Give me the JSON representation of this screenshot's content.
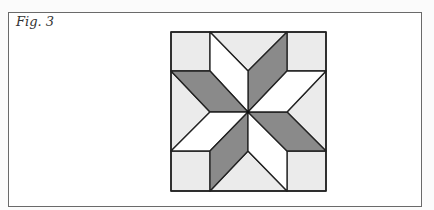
{
  "figure": {
    "caption": "Fig. 3",
    "colors": {
      "background": "#ffffff",
      "light_fill": "#ebebeb",
      "dark_fill": "#8a8a8a",
      "white_fill": "#ffffff",
      "stroke": "#222222"
    },
    "block": {
      "x": 171,
      "y": 32,
      "width": 155,
      "height": 159,
      "grid_x": [
        171,
        210,
        248,
        287,
        326
      ],
      "grid_y": [
        32,
        71,
        112,
        151,
        191
      ],
      "center": [
        248,
        112
      ]
    },
    "pieces": {
      "corner_squares": 4,
      "side_triangles": 4,
      "dark_diamonds": 4,
      "white_diamonds": 4
    }
  }
}
